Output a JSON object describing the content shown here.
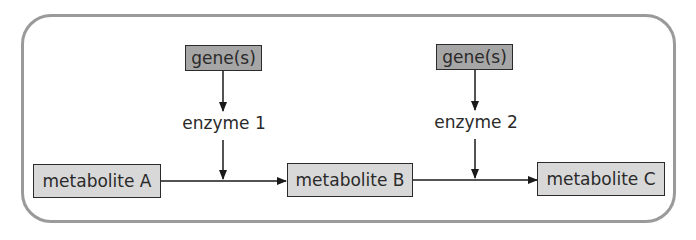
{
  "diagram": {
    "type": "metabolic-pathway",
    "nodes": {
      "gene_1": "gene(s)",
      "gene_2": "gene(s)",
      "enzyme_1": "enzyme 1",
      "enzyme_2": "enzyme 2",
      "metabolite_a": "metabolite A",
      "metabolite_b": "metabolite B",
      "metabolite_c": "metabolite C"
    },
    "edges": [
      {
        "from": "gene_1",
        "to": "enzyme_1"
      },
      {
        "from": "enzyme_1",
        "to": "reaction_1"
      },
      {
        "from": "metabolite_a",
        "to": "metabolite_b"
      },
      {
        "from": "gene_2",
        "to": "enzyme_2"
      },
      {
        "from": "enzyme_2",
        "to": "reaction_2"
      },
      {
        "from": "metabolite_b",
        "to": "metabolite_c"
      }
    ],
    "colors": {
      "frame": "#9a9a9a",
      "gene_fill": "#a6a6a6",
      "metabolite_fill": "#d8d8d8",
      "line": "#1a1a1a",
      "text": "#2a2a2a"
    }
  }
}
